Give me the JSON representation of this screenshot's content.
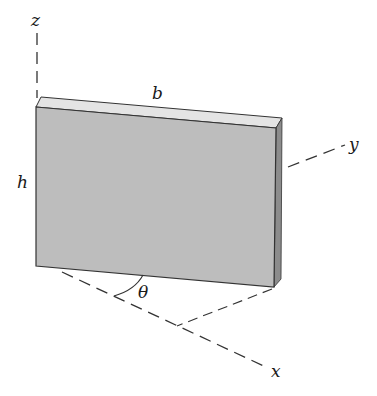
{
  "diagram": {
    "axes": {
      "z": "z",
      "y": "y",
      "x": "x"
    },
    "dimensions": {
      "width": "b",
      "height": "h"
    },
    "angle": "θ",
    "colors": {
      "face": "#bdbdbd",
      "top_edge": "#e4e4e4",
      "side_edge": "#8c8c8c",
      "lines": "#333333"
    }
  }
}
